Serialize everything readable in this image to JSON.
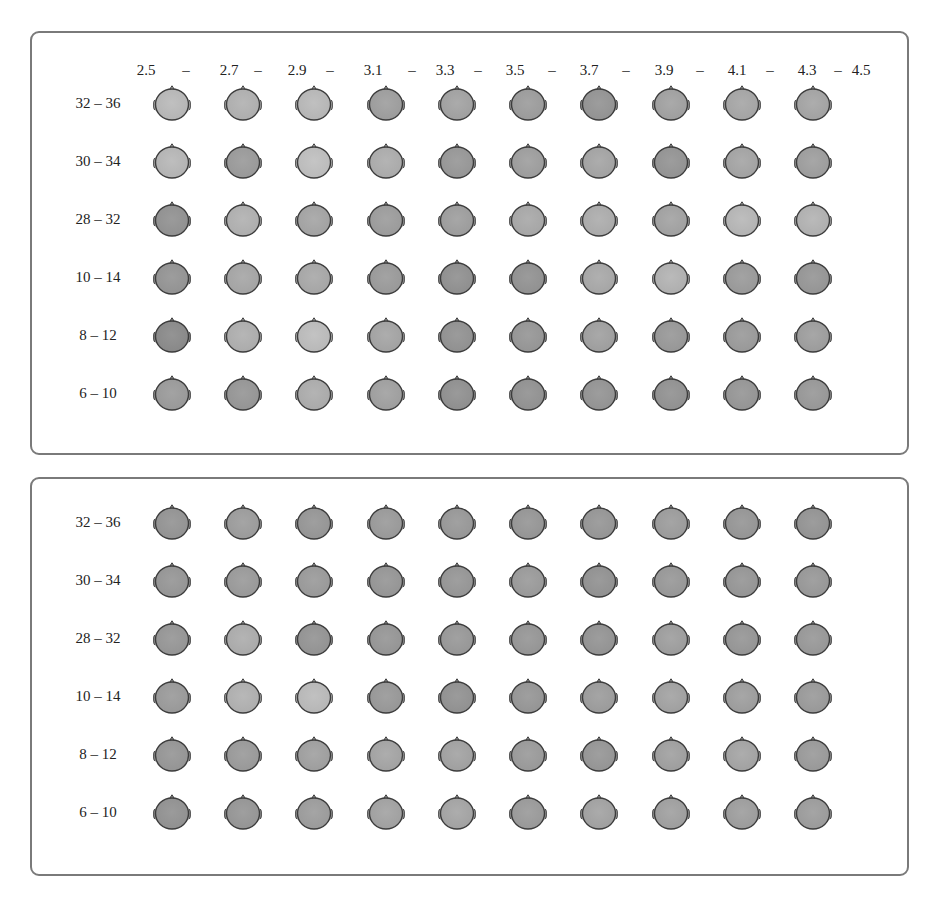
{
  "figure": {
    "frequency_bins_hz": [
      "2.5",
      "2.7",
      "2.9",
      "3.1",
      "3.3",
      "3.5",
      "3.7",
      "3.9",
      "4.1",
      "4.3",
      "4.5"
    ],
    "separator": "–",
    "row_labels": [
      "32 – 36",
      "30 – 34",
      "28 – 32",
      "10 – 14",
      "8 – 12",
      "6 – 10"
    ],
    "panels": [
      {
        "id": "top",
        "shades": [
          [
            0.78,
            0.7,
            0.78,
            0.52,
            0.56,
            0.5,
            0.42,
            0.55,
            0.6,
            0.58
          ],
          [
            0.76,
            0.48,
            0.84,
            0.66,
            0.45,
            0.52,
            0.58,
            0.42,
            0.58,
            0.52
          ],
          [
            0.4,
            0.7,
            0.58,
            0.5,
            0.52,
            0.62,
            0.66,
            0.56,
            0.76,
            0.72
          ],
          [
            0.42,
            0.6,
            0.62,
            0.48,
            0.38,
            0.4,
            0.62,
            0.72,
            0.48,
            0.44
          ],
          [
            0.32,
            0.68,
            0.82,
            0.58,
            0.4,
            0.44,
            0.54,
            0.46,
            0.48,
            0.52
          ],
          [
            0.48,
            0.44,
            0.66,
            0.54,
            0.38,
            0.4,
            0.42,
            0.4,
            0.44,
            0.46
          ]
        ]
      },
      {
        "id": "bottom",
        "shades": [
          [
            0.42,
            0.5,
            0.44,
            0.48,
            0.46,
            0.44,
            0.44,
            0.5,
            0.44,
            0.42
          ],
          [
            0.44,
            0.48,
            0.48,
            0.44,
            0.44,
            0.48,
            0.4,
            0.46,
            0.44,
            0.46
          ],
          [
            0.44,
            0.66,
            0.42,
            0.44,
            0.46,
            0.44,
            0.42,
            0.52,
            0.44,
            0.46
          ],
          [
            0.48,
            0.7,
            0.8,
            0.46,
            0.4,
            0.44,
            0.5,
            0.56,
            0.52,
            0.48
          ],
          [
            0.44,
            0.48,
            0.54,
            0.58,
            0.56,
            0.48,
            0.44,
            0.54,
            0.58,
            0.48
          ],
          [
            0.4,
            0.44,
            0.5,
            0.56,
            0.58,
            0.48,
            0.56,
            0.54,
            0.52,
            0.5
          ]
        ]
      }
    ]
  },
  "layout": {
    "columns_x": [
      172,
      243,
      314,
      386,
      457,
      528,
      599,
      671,
      742,
      813
    ],
    "top_rows_y": [
      103,
      161,
      219,
      277,
      335,
      393
    ],
    "bottom_rows_y": [
      522,
      580,
      638,
      696,
      754,
      812
    ],
    "header_ticks_x": [
      146,
      229,
      297,
      373,
      445,
      515,
      589,
      664,
      737,
      807,
      861
    ],
    "header_seps_x": [
      186,
      258,
      330,
      412,
      478,
      552,
      626,
      700,
      770,
      838
    ]
  },
  "colors": {
    "frame": "#7a7a7a",
    "head_light": "#c9c9c9",
    "head_dark": "#6a6a6a",
    "outline": "#3c3c3c"
  }
}
